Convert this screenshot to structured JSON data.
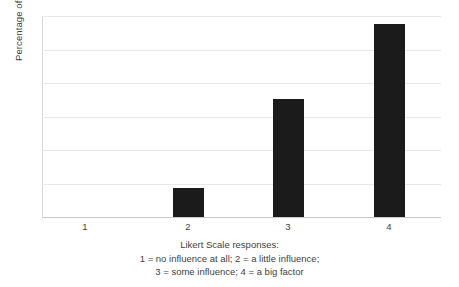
{
  "chart_data": {
    "type": "bar",
    "title": "",
    "subtitle": "",
    "xlabel": "Likert Scale responses:",
    "ylabel": "Percentage of students",
    "categories": [
      "1",
      "2",
      "3",
      "4"
    ],
    "values": [
      0,
      8.6,
      35.1,
      57.5
    ],
    "series": [
      {
        "name": "Percentage of students",
        "values": [
          0,
          8.6,
          35.1,
          57.5
        ]
      }
    ],
    "ylim": [
      0,
      60
    ],
    "yticks": [
      0,
      10,
      20,
      30,
      40,
      50,
      60
    ],
    "ytick_labels": [
      "",
      "",
      "",
      "",
      "",
      "",
      ""
    ],
    "grid": true,
    "grid_axis": "y",
    "legend": false,
    "legend_position": "none",
    "bar_color": "#1b1b1b",
    "grid_color": "#e8e8e8",
    "axis_color": "#c9c9c9",
    "background": "#ffffff",
    "annotations": [
      "1 = no influence at all; 2 = a little influence;",
      "3 = some influence; 4 = a big factor"
    ]
  },
  "axes": {
    "y_title": "Percentage of students",
    "x_tick_labels": [
      "1",
      "2",
      "3",
      "4"
    ]
  },
  "caption": {
    "line1": "Likert Scale responses:",
    "line2": "1 = no influence at all; 2 = a little influence;",
    "line3": "3 = some influence; 4 = a big factor"
  }
}
